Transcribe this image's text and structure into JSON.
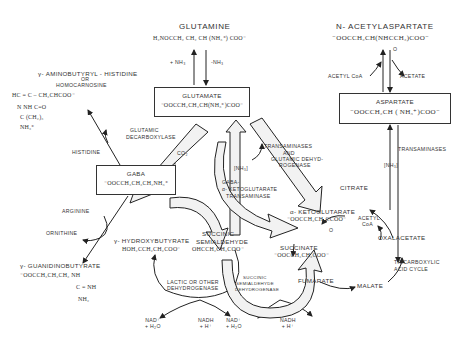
{
  "compounds": {
    "glutamine": {
      "name": "GLUTAMINE",
      "formula": "H₂NOCCH₂ CH₂ CH (NH₃⁺) COO⁻"
    },
    "glutamate": {
      "name": "GLUTAMATE",
      "formula": "⁻OOCCH₂CH₂CH(NH₃⁺)COO⁻"
    },
    "n_acetylaspartate": {
      "name": "N- ACETYLASPARTATE",
      "formula": "⁻OOCCH₂CH(NHCCH₃)COO⁻",
      "sub": "O"
    },
    "aspartate": {
      "name": "ASPARTATE",
      "formula": "⁻OOCCH₂CH ( NH₃⁺)COO⁻"
    },
    "homocarnosine": {
      "name": "γ- AMINOBUTYRYL - HISTIDINE",
      "or": "OR",
      "alt": "HOMOCARNOSINE",
      "formula_lines": [
        "HC = C – CH₂CHCOO⁻",
        "N      NH        C=O",
        "     C              (CH₂)₃",
        "                      NH₃⁺"
      ]
    },
    "gaba": {
      "name": "GABA",
      "formula": "⁻OOCCH₂CH₂CH₂NH₃⁺"
    },
    "guanidinobutyrate": {
      "name": "γ- GUANIDINOBUTYRATE",
      "formula": "⁻OOCCH₂CH₂CH₂ NH",
      "sub1": "C = NH",
      "sub2": "NH₂"
    },
    "hydroxybutyrate": {
      "name": "γ- HYDROXYBUTYRATE",
      "formula": "HOH₂CCH₂CH₂COO⁻"
    },
    "succinic_semialdehyde": {
      "name1": "SUCCINIC",
      "name2": "SEMIALDEHYDE",
      "formula": "OHCCH₂CH₂COO⁻"
    },
    "alpha_ketoglutarate": {
      "name": "α- KETOGLUTARATE",
      "formula": "⁻OOCCH₂CH₂CCOO⁻",
      "sub": "O"
    },
    "succinate": {
      "name": "SUCCINATE",
      "formula": "⁻OOCCH₂CH₂COO⁻"
    },
    "citrate": {
      "name": "CITRATE"
    },
    "oxalacetate": {
      "name": "OXALACETATE"
    },
    "malate": {
      "name": "MALATE"
    },
    "fumarate": {
      "name": "FUMARATE"
    }
  },
  "labels": {
    "plus_nh3": "+ NH₃",
    "minus_nh3": "-NH₃",
    "acetyl_coa_top": "ACETYL CoA",
    "acetate": "ACETATE",
    "transaminases_right": "TRANSAMINASES",
    "nh3_bracket_right": "[NH₃]",
    "glutamic_decarboxylase": [
      "GLUTAMIC",
      "DECARBOXYLASE"
    ],
    "co2": "CO₂",
    "histidine": "HISTIDINE",
    "transaminases_gdh": [
      "TRANSAMINASES",
      "AND",
      "GLUTAMIC DEHYD-",
      "ROGENASE"
    ],
    "nh3_bracket_mid": "[NH₃]",
    "gaba_transaminase": [
      "GABA-",
      "α- KETOGLUTARATE",
      "TRANSAMINASE"
    ],
    "arginine": "ARGININE",
    "ornithine": "ORNITHINE",
    "acetyl_coa_cycle": [
      "ACETYL",
      "CoA"
    ],
    "tca_cycle": [
      "TRICARBOXYLIC",
      "ACID CYCLE"
    ],
    "lactic_dh": [
      "LACTIC OR OTHER",
      "DEHYDROGENASE"
    ],
    "ssadh": [
      "SUCCINIC",
      "SEMIALDEHYDE",
      "DEHYDROGENASE"
    ],
    "nad1": [
      "NAD⁺",
      "+ H₂O"
    ],
    "nadh1": [
      "NADH",
      "+ H⁺"
    ],
    "nad2": [
      "NAD⁺",
      "+ H₂O"
    ],
    "nadh2": [
      "NADH",
      "+ H⁺"
    ]
  }
}
